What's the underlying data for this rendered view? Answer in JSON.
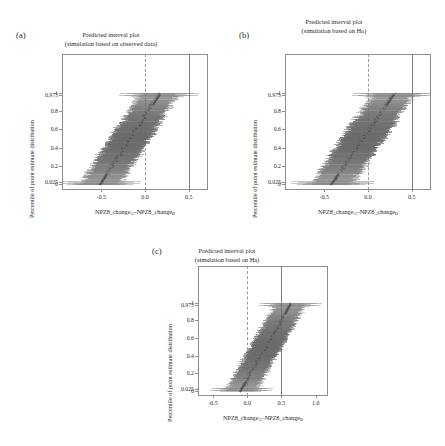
{
  "figure": {
    "panels": [
      {
        "label": "(a)",
        "title_line1": "Predicted interval plot",
        "title_line2": "(simulation based on observed data)",
        "ylabel": "Percentile of point estimate distribution",
        "xlabel_pre": "NPZ8_change",
        "xlabel_subA": "A",
        "xlabel_mid": "–NPZ8_change",
        "xlabel_subB": "B",
        "yticks": [
          "0",
          "0.025",
          "0.2",
          "0.4",
          "0.6",
          "0.8",
          "0.975",
          "1"
        ],
        "ytickvals": [
          0,
          0.025,
          0.2,
          0.4,
          0.6,
          0.8,
          0.975,
          1
        ],
        "xticks": [
          "-0.5",
          "0.0",
          "0.5"
        ],
        "xtickvals": [
          -0.5,
          0.0,
          0.5
        ],
        "xlim": [
          -0.95,
          0.72
        ],
        "ylim": [
          -0.06,
          1.42
        ],
        "ref_dashed_x": 0.0,
        "ref_solid_x": 0.5,
        "band_center_low": -0.52,
        "band_center_high": 0.17,
        "ci_halfwidth": 0.21
      },
      {
        "label": "(b)",
        "title_line1": "Predicted interval plot",
        "title_line2": "(simulation based on Ho)",
        "ylabel": "Percentile of point estimate distribution",
        "xlabel_pre": "NPZ8_change",
        "xlabel_subA": "A",
        "xlabel_mid": "–NPZ8_change",
        "xlabel_subB": "B",
        "yticks": [
          "0",
          "0.025",
          "0.2",
          "0.4",
          "0.6",
          "0.8",
          "0.975",
          "1"
        ],
        "ytickvals": [
          0,
          0.025,
          0.2,
          0.4,
          0.6,
          0.8,
          0.975,
          1
        ],
        "xticks": [
          "-0.5",
          "0.0",
          "0.5"
        ],
        "xtickvals": [
          -0.5,
          0.0,
          0.5
        ],
        "xlim": [
          -0.95,
          0.72
        ],
        "ylim": [
          -0.06,
          1.42
        ],
        "ref_dashed_x": 0.0,
        "ref_solid_x": 0.5,
        "band_center_low": -0.42,
        "band_center_high": 0.3,
        "ci_halfwidth": 0.22
      },
      {
        "label": "(c)",
        "title_line1": "Predicted interval plot",
        "title_line2": "(simulation based on Ha)",
        "ylabel": "Percentile of point estimate distribution",
        "xlabel_pre": "NPZ8_change",
        "xlabel_subA": "A",
        "xlabel_mid": "–NPZ8_change",
        "xlabel_subB": "B",
        "yticks": [
          "0",
          "0.025",
          "0.2",
          "0.4",
          "0.6",
          "0.8",
          "0.975",
          "1"
        ],
        "ytickvals": [
          0,
          0.025,
          0.2,
          0.4,
          0.6,
          0.8,
          0.975,
          1
        ],
        "xticks": [
          "-0.5",
          "0.0",
          "0.5",
          "1.0"
        ],
        "xtickvals": [
          -0.5,
          0.0,
          0.5,
          1.0
        ],
        "xlim": [
          -0.72,
          1.18
        ],
        "ylim": [
          -0.06,
          1.42
        ],
        "ref_dashed_x": 0.0,
        "ref_solid_x": 0.5,
        "band_center_low": -0.1,
        "band_center_high": 0.64,
        "ci_halfwidth": 0.21
      }
    ]
  },
  "chart_data": {
    "type": "scatter",
    "title": "Predicted interval plot",
    "xlabel": "NPZ8_changeA – NPZ8_changeB",
    "ylabel": "Percentile of point estimate distribution",
    "grid": false,
    "legend": "none",
    "series": [
      {
        "name": "(a) simulation based on observed data",
        "xlim": [
          -0.95,
          0.72
        ],
        "ylim": [
          -0.06,
          1.42
        ],
        "reference_lines": [
          {
            "x": 0.0,
            "style": "dashed"
          },
          {
            "x": 0.5,
            "style": "solid"
          }
        ],
        "percentiles": [
          0,
          0.025,
          0.2,
          0.4,
          0.6,
          0.8,
          0.975,
          1
        ],
        "point_estimate_at_percentile": [
          -0.52,
          -0.47,
          -0.33,
          -0.25,
          -0.17,
          -0.08,
          0.1,
          0.17
        ],
        "ci_lower_at_percentile": [
          -0.73,
          -0.68,
          -0.54,
          -0.46,
          -0.38,
          -0.29,
          -0.11,
          -0.04
        ],
        "ci_upper_at_percentile": [
          -0.31,
          -0.26,
          -0.12,
          -0.04,
          0.04,
          0.13,
          0.31,
          0.38
        ]
      },
      {
        "name": "(b) simulation based on Ho",
        "xlim": [
          -0.95,
          0.72
        ],
        "ylim": [
          -0.06,
          1.42
        ],
        "reference_lines": [
          {
            "x": 0.0,
            "style": "dashed"
          },
          {
            "x": 0.5,
            "style": "solid"
          }
        ],
        "percentiles": [
          0,
          0.025,
          0.2,
          0.4,
          0.6,
          0.8,
          0.975,
          1
        ],
        "point_estimate_at_percentile": [
          -0.42,
          -0.37,
          -0.22,
          -0.14,
          -0.05,
          0.04,
          0.23,
          0.3
        ],
        "ci_lower_at_percentile": [
          -0.64,
          -0.59,
          -0.44,
          -0.36,
          -0.27,
          -0.18,
          0.01,
          0.08
        ],
        "ci_upper_at_percentile": [
          -0.2,
          -0.15,
          0.0,
          0.08,
          0.17,
          0.26,
          0.45,
          0.52
        ]
      },
      {
        "name": "(c) simulation based on Ha",
        "xlim": [
          -0.72,
          1.18
        ],
        "ylim": [
          -0.06,
          1.42
        ],
        "reference_lines": [
          {
            "x": 0.0,
            "style": "dashed"
          },
          {
            "x": 0.5,
            "style": "solid"
          }
        ],
        "percentiles": [
          0,
          0.025,
          0.2,
          0.4,
          0.6,
          0.8,
          0.975,
          1
        ],
        "point_estimate_at_percentile": [
          -0.1,
          -0.05,
          0.11,
          0.2,
          0.29,
          0.38,
          0.57,
          0.64
        ],
        "ci_lower_at_percentile": [
          -0.31,
          -0.26,
          -0.1,
          -0.01,
          0.08,
          0.17,
          0.36,
          0.43
        ],
        "ci_upper_at_percentile": [
          0.11,
          0.16,
          0.32,
          0.41,
          0.5,
          0.59,
          0.78,
          0.85
        ]
      }
    ]
  }
}
